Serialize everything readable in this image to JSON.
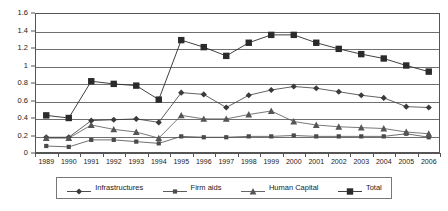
{
  "chart_data": {
    "type": "line",
    "title": "",
    "xlabel": "",
    "ylabel": "",
    "ylim": [
      0,
      1.6
    ],
    "ytick_labels": [
      "0",
      "0.2",
      "0.4",
      "0.6",
      "0.8",
      "1",
      "1.2",
      "1.4",
      "1.6"
    ],
    "ytick_values": [
      0,
      0.2,
      0.4,
      0.6,
      0.8,
      1,
      1.2,
      1.4,
      1.6
    ],
    "grid": true,
    "legend_position": "bottom",
    "categories": [
      "1989",
      "1990",
      "1991",
      "1992",
      "1993",
      "1994",
      "1995",
      "1996",
      "1997",
      "1998",
      "1999",
      "2000",
      "2001",
      "2002",
      "2003",
      "2004",
      "2005",
      "2006"
    ],
    "series": [
      {
        "name": "Infrastructures",
        "marker": "diamond",
        "color": "#3a3a3a",
        "values": [
          0.18,
          0.18,
          0.37,
          0.38,
          0.39,
          0.35,
          0.69,
          0.67,
          0.52,
          0.66,
          0.72,
          0.76,
          0.74,
          0.7,
          0.66,
          0.63,
          0.53,
          0.52
        ]
      },
      {
        "name": "Firm aids",
        "marker": "square-small",
        "color": "#4a4a4a",
        "values": [
          0.08,
          0.07,
          0.15,
          0.15,
          0.13,
          0.11,
          0.19,
          0.18,
          0.18,
          0.19,
          0.19,
          0.2,
          0.19,
          0.19,
          0.19,
          0.19,
          0.22,
          0.18
        ]
      },
      {
        "name": "Human Capital",
        "marker": "triangle",
        "color": "#555555",
        "values": [
          0.17,
          0.17,
          0.32,
          0.27,
          0.24,
          0.17,
          0.43,
          0.39,
          0.39,
          0.44,
          0.48,
          0.36,
          0.32,
          0.3,
          0.29,
          0.28,
          0.24,
          0.22
        ]
      },
      {
        "name": "Total",
        "marker": "square-large",
        "color": "#2b2b2b",
        "values": [
          0.43,
          0.4,
          0.82,
          0.79,
          0.77,
          0.61,
          1.29,
          1.21,
          1.11,
          1.26,
          1.35,
          1.35,
          1.26,
          1.19,
          1.13,
          1.08,
          1.0,
          0.93
        ]
      }
    ]
  },
  "legend": {
    "items": [
      {
        "label": "Infrastructures",
        "marker": "diamond"
      },
      {
        "label": "Firm aids",
        "marker": "square-small"
      },
      {
        "label": "Human Capital",
        "marker": "triangle"
      },
      {
        "label": "Total",
        "marker": "square-large"
      }
    ]
  }
}
